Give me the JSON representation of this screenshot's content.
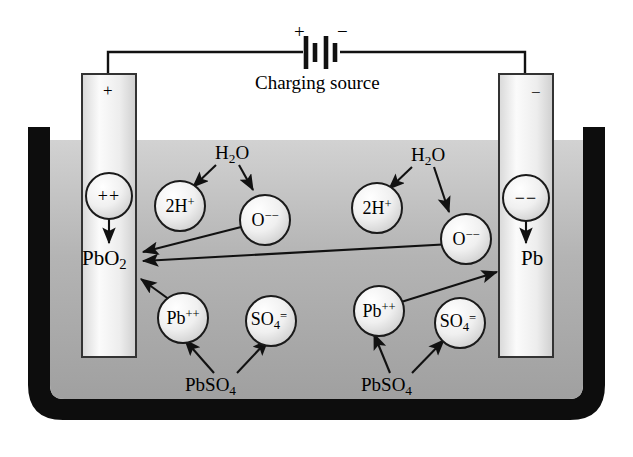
{
  "diagram": {
    "source": {
      "caption": "Charging source",
      "plus_terminal": "+",
      "minus_terminal": "−"
    },
    "electrodes": [
      {
        "id": "positive",
        "polarity_sign": "+",
        "material": "PbO",
        "material_sub": "2",
        "ion_label": "++"
      },
      {
        "id": "negative",
        "polarity_sign": "−",
        "material": "Pb",
        "material_sub": "",
        "ion_label": "−−"
      }
    ],
    "reactant_labels": [
      {
        "name": "water-left",
        "text": "H",
        "sub": "2",
        "tail": "O"
      },
      {
        "name": "water-right",
        "text": "H",
        "sub": "2",
        "tail": "O"
      },
      {
        "name": "lead-sulfate-left",
        "text": "PbSO",
        "sub": "4",
        "tail": ""
      },
      {
        "name": "lead-sulfate-right",
        "text": "PbSO",
        "sub": "4",
        "tail": ""
      }
    ],
    "ions": [
      {
        "name": "hydrogen-ion-left",
        "base": "2H",
        "sup": "+",
        "sub": ""
      },
      {
        "name": "oxide-ion-left",
        "base": "O",
        "sup": "−−",
        "sub": ""
      },
      {
        "name": "hydrogen-ion-right",
        "base": "2H",
        "sup": "+",
        "sub": ""
      },
      {
        "name": "oxide-ion-right",
        "base": "O",
        "sup": "−−",
        "sub": ""
      },
      {
        "name": "lead-ion-left",
        "base": "Pb",
        "sup": "++",
        "sub": ""
      },
      {
        "name": "sulfate-ion-left",
        "base": "SO",
        "sup": "=",
        "sub": "4"
      },
      {
        "name": "lead-ion-right",
        "base": "Pb",
        "sup": "++",
        "sub": ""
      },
      {
        "name": "sulfate-ion-right",
        "base": "SO",
        "sup": "=",
        "sub": "4"
      }
    ],
    "colors": {
      "container_wall": "#0d0d0d",
      "electrolyte_top": "#cfcfcf",
      "electrolyte_bottom": "#9e9e9e",
      "bubble_fill": "#ededed",
      "electrode_fill": "#e8e8e8",
      "stroke": "#1a1a1a",
      "background": "#ffffff"
    }
  }
}
